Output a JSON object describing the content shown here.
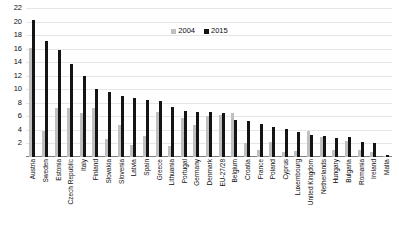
{
  "chart_data": {
    "type": "bar",
    "title": "",
    "subtitle": "",
    "xlabel": "",
    "ylabel": "",
    "ylim": [
      0,
      22
    ],
    "ytick_step": 2,
    "yticks": [
      2,
      4,
      6,
      8,
      10,
      12,
      14,
      16,
      18,
      20,
      22
    ],
    "grid": true,
    "legend_position": "top-center",
    "colors": {
      "2004": "#bfbfbf",
      "2015": "#141414",
      "gridline": "#e6e6e6",
      "axis": "#7f7f7f",
      "text": "#0d0d0d"
    },
    "categories": [
      "Austria",
      "Sweden",
      "Estonia",
      "Czech Republic",
      "Italy",
      "Finland",
      "Slovakia",
      "Slovenia",
      "Latvia",
      "Spain",
      "Greece",
      "Lithuania",
      "Portugal",
      "Germany",
      "Denmark",
      "EU-27/28",
      "Belgium",
      "Croatia",
      "France",
      "Poland",
      "Cyprus",
      "Luxembourg",
      "United Kingdom",
      "Netherlands",
      "Hungary",
      "Bulgaria",
      "Romania",
      "Ireland",
      "Malta"
    ],
    "series": [
      {
        "name": "2004",
        "color": "#bfbfbf",
        "values": [
          16.1,
          3.9,
          7.2,
          7.2,
          6.5,
          7.3,
          2.6,
          4.7,
          1.8,
          3.1,
          6.6,
          1.6,
          5.8,
          4.8,
          6.1,
          6.2,
          6.5,
          2.0,
          1.0,
          2.2,
          0.8,
          0.9,
          3.8,
          2.9,
          1.1,
          2.3,
          1.0,
          0.8,
          0.1
        ]
      },
      {
        "name": "2015",
        "color": "#141414",
        "values": [
          20.3,
          17.2,
          15.8,
          13.8,
          12.0,
          10.1,
          9.6,
          9.0,
          8.7,
          8.4,
          8.2,
          7.4,
          6.8,
          6.7,
          6.6,
          6.5,
          5.5,
          5.3,
          4.9,
          4.4,
          4.1,
          3.7,
          3.3,
          3.1,
          2.8,
          2.9,
          2.2,
          2.1,
          0.3
        ]
      }
    ]
  },
  "legend": {
    "items": [
      {
        "label": "2004",
        "color": "#bfbfbf"
      },
      {
        "label": "2015",
        "color": "#141414"
      }
    ]
  },
  "axis": {
    "y_tick_labels": [
      "22",
      "20",
      "18",
      "16",
      "14",
      "12",
      "10",
      "8",
      "6",
      "4",
      "2"
    ]
  }
}
